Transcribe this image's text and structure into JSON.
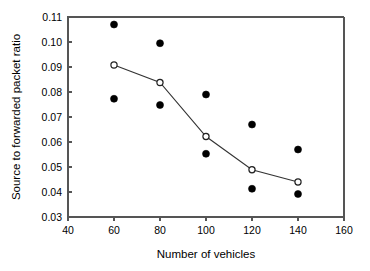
{
  "chart_data": {
    "type": "scatter",
    "title": "",
    "subtitle": "",
    "xlabel": "Number of vehicles",
    "ylabel": "Source to forwarded packet ratio",
    "xlim": [
      40,
      160
    ],
    "ylim": [
      0.03,
      0.11
    ],
    "xticks": [
      40,
      60,
      80,
      100,
      120,
      140,
      160
    ],
    "xtick_labels": [
      "40",
      "60",
      "80",
      "100",
      "120",
      "140",
      "160"
    ],
    "yticks": [
      0.03,
      0.04,
      0.05,
      0.06,
      0.07,
      0.08,
      0.09,
      0.1,
      0.11
    ],
    "ytick_labels": [
      "0.03",
      "0.04",
      "0.05",
      "0.06",
      "0.07",
      "0.08",
      "0.09",
      "0.10",
      "0.11"
    ],
    "grid": false,
    "legend": false,
    "legend_position": "none",
    "x": [
      60,
      80,
      100,
      120,
      140
    ],
    "series": [
      {
        "name": "upper-bound-points",
        "marker": "filled-circle",
        "line": false,
        "values": [
          0.107,
          0.0995,
          0.079,
          0.067,
          0.057
        ]
      },
      {
        "name": "mean-line",
        "marker": "open-circle",
        "line": true,
        "values": [
          0.0908,
          0.0838,
          0.0622,
          0.0489,
          0.044
        ]
      },
      {
        "name": "lower-bound-points",
        "marker": "filled-circle",
        "line": false,
        "values": [
          0.0773,
          0.0748,
          0.0553,
          0.0413,
          0.0392
        ]
      }
    ],
    "colors": {
      "axis": "#555555",
      "line": "#333333",
      "filled_marker": "#000000",
      "open_marker_fill": "#ffffff",
      "open_marker_stroke": "#222222",
      "background": "#ffffff"
    }
  }
}
